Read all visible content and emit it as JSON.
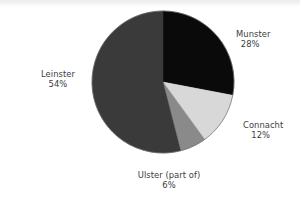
{
  "chart_data": {
    "type": "pie",
    "title": "",
    "subtitle": "",
    "xlabel": "",
    "ylabel": "",
    "legend_position": "none",
    "grid": false,
    "units": "percent",
    "start_angle_deg": 0,
    "direction": "clockwise",
    "center": {
      "x": 163,
      "y": 82
    },
    "radius": 71,
    "categories": [
      "Munster",
      "Connacht",
      "Ulster (part of)",
      "Leinster"
    ],
    "values": [
      28,
      12,
      6,
      54
    ],
    "slices": [
      {
        "name": "Munster",
        "label": "Munster",
        "value": 28,
        "value_label": "28%",
        "color": "#0a0a0a",
        "start_deg": 0,
        "end_deg": 100.8
      },
      {
        "name": "Connacht",
        "label": "Connacht",
        "value": 12,
        "value_label": "12%",
        "color": "#d8d8d8",
        "start_deg": 100.8,
        "end_deg": 144.0
      },
      {
        "name": "Ulster",
        "label": "Ulster (part of)",
        "value": 6,
        "value_label": "6%",
        "color": "#8a8a8a",
        "start_deg": 144.0,
        "end_deg": 165.6
      },
      {
        "name": "Leinster",
        "label": "Leinster",
        "value": 54,
        "value_label": "54%",
        "color": "#3a3a3a",
        "start_deg": 165.6,
        "end_deg": 360.0
      }
    ]
  },
  "labels": {
    "munster": {
      "name": "Munster",
      "percent": "28%"
    },
    "connacht": {
      "name": "Connacht",
      "percent": "12%"
    },
    "ulster": {
      "name": "Ulster (part of)",
      "percent": "6%"
    },
    "leinster": {
      "name": "Leinster",
      "percent": "54%"
    }
  },
  "colors": {
    "background": "#ffffff",
    "label_text": "#3c3c40",
    "slice_munster": "#0a0a0a",
    "slice_connacht": "#d8d8d8",
    "slice_ulster": "#8a8a8a",
    "slice_leinster": "#3a3a3a",
    "slice_outline": "#6f6f6f"
  }
}
